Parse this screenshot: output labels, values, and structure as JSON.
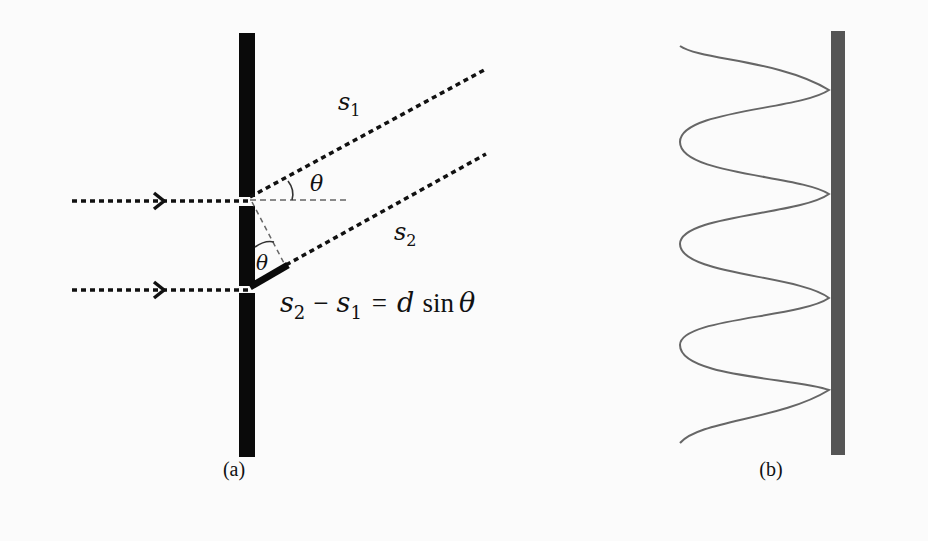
{
  "figure": {
    "panel_a": {
      "caption": "(a)",
      "labels": {
        "s1": "s",
        "s1_sub": "1",
        "s2": "s",
        "s2_sub": "2",
        "theta_top": "θ",
        "theta_bottom": "θ",
        "equation_s2": "s",
        "equation_s2_sub": "2",
        "equation_minus": "−",
        "equation_s1": "s",
        "equation_s1_sub": "1",
        "equation_eq": "=",
        "equation_d": "d",
        "equation_sin": "sin",
        "equation_theta": "θ"
      },
      "description": "Two slits in a barrier; incoming rays (dotted with arrowheads) pass through and exit at angle θ; path difference s2 − s1 = d sin θ"
    },
    "panel_b": {
      "caption": "(b)",
      "description": "Intensity pattern drawn as a sinusoidal curve against a screen (vertical grey bar)",
      "peaks": 3,
      "troughs": 3
    },
    "colors": {
      "barrier": "#0a0a0a",
      "screen": "#555555",
      "curve": "#666666",
      "background": "#fbfbfb"
    }
  }
}
